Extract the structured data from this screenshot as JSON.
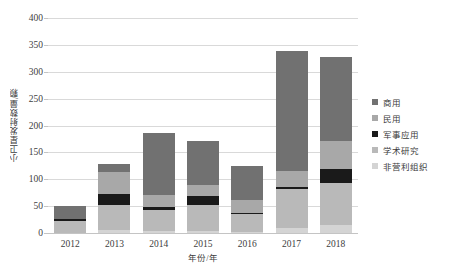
{
  "chart_data": {
    "type": "bar",
    "stacked": true,
    "title": "",
    "subtitle": "",
    "xlabel": "年份/年",
    "ylabel": "小卫星发射数量/颗",
    "categories": [
      "2012",
      "2013",
      "2014",
      "2015",
      "2016",
      "2017",
      "2018"
    ],
    "ylim": [
      0,
      400
    ],
    "ytick_labels": [
      "0",
      "50",
      "100",
      "150",
      "200",
      "250",
      "300",
      "350",
      "400"
    ],
    "ytick_values": [
      0,
      50,
      100,
      150,
      200,
      250,
      300,
      350,
      400
    ],
    "grid": true,
    "legend_position": "right",
    "series": [
      {
        "name": "非营利组织",
        "color": "#d4d4d4",
        "values": [
          0,
          6,
          4,
          3,
          2,
          9,
          15
        ]
      },
      {
        "name": "学术研究",
        "color": "#b9b9b9",
        "values": [
          22,
          46,
          39,
          50,
          33,
          73,
          78
        ]
      },
      {
        "name": "军事应用",
        "color": "#1a1a1a",
        "values": [
          5,
          20,
          5,
          16,
          2,
          4,
          27
        ]
      },
      {
        "name": "民用",
        "color": "#a8a8a8",
        "values": [
          0,
          42,
          23,
          21,
          24,
          29,
          52
        ]
      },
      {
        "name": "商用",
        "color": "#717171",
        "values": [
          24,
          14,
          115,
          82,
          64,
          223,
          155
        ]
      }
    ],
    "totals": [
      51,
      128,
      186,
      172,
      125,
      338,
      327
    ]
  },
  "legend": {
    "items": [
      {
        "label": "商用",
        "color": "#717171"
      },
      {
        "label": "民用",
        "color": "#a8a8a8"
      },
      {
        "label": "军事应用",
        "color": "#1a1a1a"
      },
      {
        "label": "学术研究",
        "color": "#b9b9b9"
      },
      {
        "label": "非营利组织",
        "color": "#d4d4d4"
      }
    ]
  },
  "colors": {
    "grid": "#d9d9d9",
    "axis": "#c4c4c4",
    "text": "#404040",
    "background": "#ffffff"
  }
}
